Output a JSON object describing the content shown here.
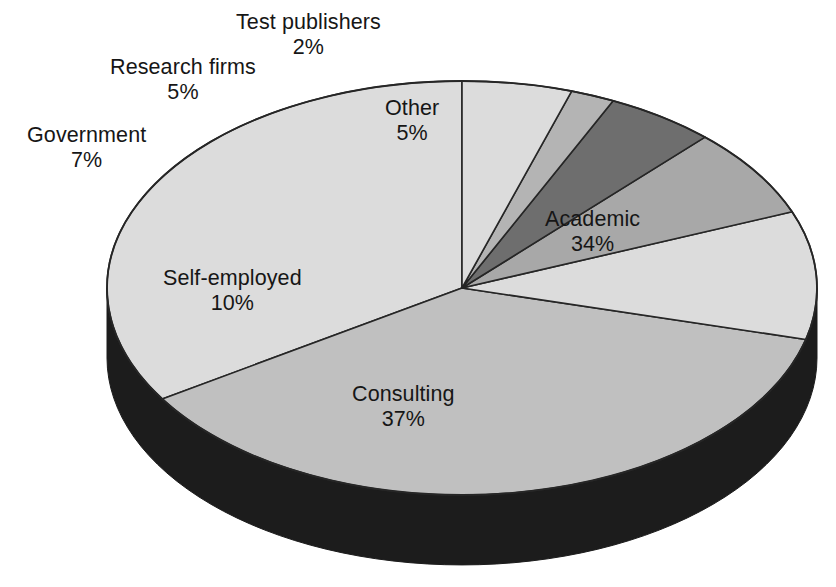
{
  "chart_data": {
    "type": "pie",
    "title": "",
    "subtitle": "",
    "xlabel": "",
    "ylabel": "",
    "legend_position": "none",
    "grid": false,
    "style": "3d-exploded-none",
    "units": "percent",
    "categories": [
      "Academic",
      "Consulting",
      "Self-employed",
      "Government",
      "Research firms",
      "Test publishers",
      "Other"
    ],
    "values": [
      34,
      37,
      10,
      7,
      5,
      2,
      5
    ],
    "slices": [
      {
        "name": "Academic",
        "value": 34,
        "value_label": "34%",
        "color": "#dcdcdc",
        "label_x": 545,
        "label_y": 207,
        "label_placement": "inside"
      },
      {
        "name": "Consulting",
        "value": 37,
        "value_label": "37%",
        "color": "#c0c0c0",
        "label_x": 352,
        "label_y": 382,
        "label_placement": "inside"
      },
      {
        "name": "Self-employed",
        "value": 10,
        "value_label": "10%",
        "color": "#dcdcdc",
        "label_x": 163,
        "label_y": 266,
        "label_placement": "inside"
      },
      {
        "name": "Government",
        "value": 7,
        "value_label": "7%",
        "color": "#a8a8a8",
        "label_x": 27,
        "label_y": 123,
        "label_placement": "outside"
      },
      {
        "name": "Research firms",
        "value": 5,
        "value_label": "5%",
        "color": "#6e6e6e",
        "label_x": 110,
        "label_y": 55,
        "label_placement": "outside"
      },
      {
        "name": "Test publishers",
        "value": 2,
        "value_label": "2%",
        "color": "#b4b4b4",
        "label_x": 236,
        "label_y": 10,
        "label_placement": "outside"
      },
      {
        "name": "Other",
        "value": 5,
        "value_label": "5%",
        "color": "#dcdcdc",
        "label_x": 385,
        "label_y": 96,
        "label_placement": "inside"
      }
    ],
    "colors": {
      "background": "#ffffff",
      "outline": "#262626",
      "side_wall": "#1c1c1c",
      "text": "#161616",
      "light_gray": "#dcdcdc",
      "medium_gray": "#c0c0c0",
      "medium_light_gray": "#b4b4b4",
      "medium_dark_gray": "#a8a8a8",
      "dark_gray": "#6e6e6e"
    },
    "geometry": {
      "center_x": 462,
      "center_y": 288,
      "radius_x": 355,
      "radius_y": 207,
      "depth": 70,
      "start_angle_deg": 90,
      "direction": "counterclockwise"
    }
  }
}
